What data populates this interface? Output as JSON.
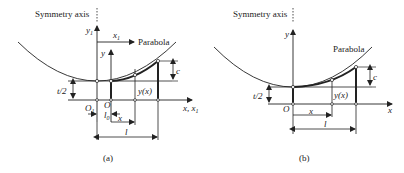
{
  "figure": {
    "panel_a": {
      "caption": "(a)",
      "symmetry_axis_label": "Symmetry axis",
      "parabola_label": "Parabola",
      "y1_label": "y",
      "y1_sub": "1",
      "x1_label": "x",
      "x1_sub": "1",
      "y_label": "y",
      "c_label": "c",
      "t2_label": "t/2",
      "yx_label": "y(x)",
      "O1_label": "O",
      "O1_sub": "1",
      "O_label": "O",
      "l0_label": "l",
      "l0_sub": "0",
      "x_label": "x",
      "l_label": "l",
      "axis_label": "x, x",
      "axis_sub": "1"
    },
    "panel_b": {
      "caption": "(b)",
      "symmetry_axis_label": "Symmetry axis",
      "parabola_label": "Parabola",
      "y_label": "y",
      "c_label": "c",
      "t2_label": "t/2",
      "yx_label": "y(x)",
      "O_label": "O",
      "x_label": "x",
      "l_label": "l",
      "axis_label": "x"
    },
    "colors": {
      "line": "#222222",
      "background": "#ffffff"
    }
  }
}
